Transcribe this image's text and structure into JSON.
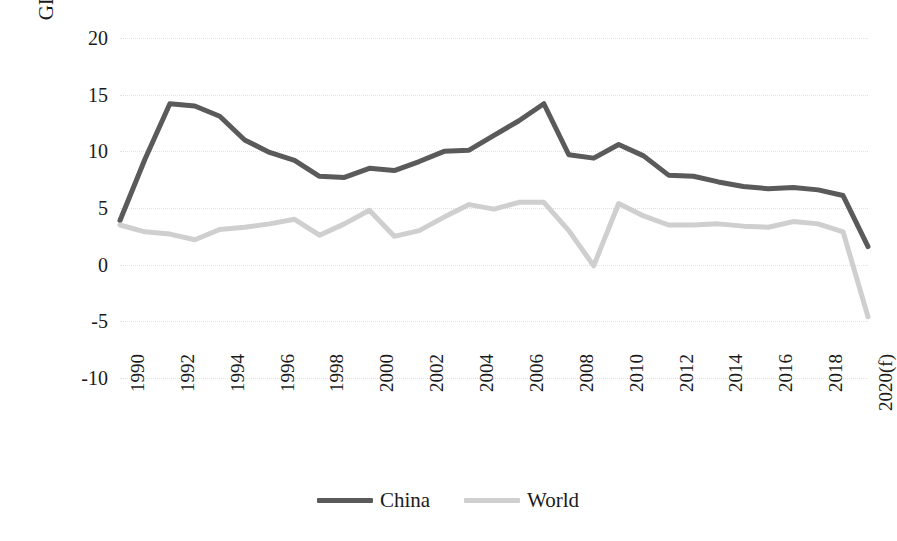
{
  "chart_data": {
    "type": "line",
    "title": "",
    "subtitle": "",
    "xlabel": "",
    "ylabel": "GDP, percentage change (%)",
    "ylim": [
      -10,
      20
    ],
    "ytick_values": [
      20,
      15,
      10,
      5,
      0,
      -5,
      -10
    ],
    "ytick_labels": [
      "20",
      "15",
      "10",
      "5",
      "0",
      "-5",
      "-10"
    ],
    "grid": true,
    "legend_position": "bottom",
    "x": [
      1990,
      1991,
      1992,
      1993,
      1994,
      1995,
      1996,
      1997,
      1998,
      1999,
      2000,
      2001,
      2002,
      2003,
      2004,
      2005,
      2006,
      2007,
      2008,
      2009,
      2010,
      2011,
      2012,
      2013,
      2014,
      2015,
      2016,
      2017,
      2018,
      2019,
      2020
    ],
    "xtick_labels": [
      "1990",
      "1992",
      "1994",
      "1996",
      "1998",
      "2000",
      "2002",
      "2004",
      "2006",
      "2008",
      "2010",
      "2012",
      "2014",
      "2016",
      "2018",
      "2020(f)"
    ],
    "xtick_values": [
      1990,
      1992,
      1994,
      1996,
      1998,
      2000,
      2002,
      2004,
      2006,
      2008,
      2010,
      2012,
      2014,
      2016,
      2018,
      2020
    ],
    "series": [
      {
        "name": "China",
        "color": "#5a5a5a",
        "values": [
          3.9,
          9.3,
          14.2,
          14.0,
          13.1,
          11.0,
          9.9,
          9.2,
          7.8,
          7.7,
          8.5,
          8.3,
          9.1,
          10.0,
          10.1,
          11.4,
          12.7,
          14.2,
          9.7,
          9.4,
          10.6,
          9.6,
          7.9,
          7.8,
          7.3,
          6.9,
          6.7,
          6.8,
          6.6,
          6.1,
          1.6
        ]
      },
      {
        "name": "World",
        "color": "#cfcfcf",
        "values": [
          3.5,
          2.9,
          2.7,
          2.2,
          3.1,
          3.3,
          3.6,
          4.0,
          2.6,
          3.6,
          4.8,
          2.5,
          3.0,
          4.2,
          5.3,
          4.9,
          5.5,
          5.5,
          3.0,
          -0.1,
          5.4,
          4.3,
          3.5,
          3.5,
          3.6,
          3.4,
          3.3,
          3.8,
          3.6,
          2.9,
          -4.6
        ]
      }
    ],
    "annotations": []
  },
  "legend": {
    "items": [
      {
        "label": "China"
      },
      {
        "label": "World"
      }
    ]
  },
  "axes": {
    "y_title": "GDP, percentage change (%)"
  }
}
